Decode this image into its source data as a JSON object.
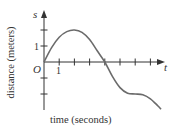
{
  "chart_data": {
    "type": "line",
    "title": "",
    "xlabel": "time (seconds)",
    "ylabel": "distance (meters)",
    "x_axis_symbol": "t",
    "y_axis_symbol": "s",
    "origin_label": "O",
    "x_tick_labels": [
      {
        "value": 1,
        "label": "1"
      }
    ],
    "y_tick_labels": [
      {
        "value": 1,
        "label": "1"
      }
    ],
    "x_ticks": [
      1,
      2,
      3,
      4,
      5,
      6,
      7
    ],
    "y_ticks": [
      -2,
      -1,
      1,
      2
    ],
    "xlim": [
      0,
      8
    ],
    "ylim": [
      -3,
      3.2
    ],
    "grid": false,
    "series": [
      {
        "name": "s(t)",
        "color": "#6b6b6b",
        "points": [
          [
            0,
            0
          ],
          [
            0.5,
            0.9
          ],
          [
            1,
            1.55
          ],
          [
            1.5,
            1.9
          ],
          [
            2,
            2.0
          ],
          [
            2.5,
            1.85
          ],
          [
            3,
            1.4
          ],
          [
            3.5,
            0.7
          ],
          [
            4,
            0.0
          ],
          [
            4.5,
            -0.9
          ],
          [
            5,
            -1.6
          ],
          [
            5.5,
            -1.95
          ],
          [
            6,
            -2.0
          ],
          [
            6.5,
            -2.05
          ],
          [
            7,
            -2.3
          ],
          [
            7.5,
            -2.75
          ],
          [
            7.7,
            -2.95
          ]
        ]
      }
    ]
  },
  "colors": {
    "axis": "#333333",
    "curve": "#6b6b6b",
    "text": "#333333",
    "background": "#ffffff"
  }
}
